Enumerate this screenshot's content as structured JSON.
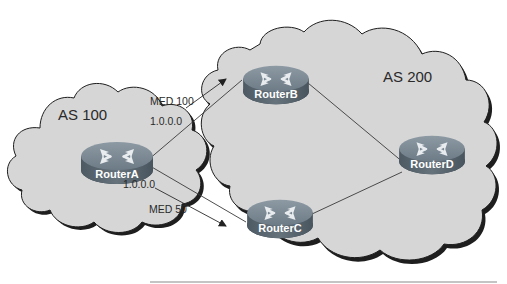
{
  "diagram": {
    "autonomous_systems": [
      {
        "id": "as100",
        "label": "AS 100",
        "fill": "#d6d6d6"
      },
      {
        "id": "as200",
        "label": "AS 200",
        "fill": "#d6d6d6"
      }
    ],
    "routers": [
      {
        "id": "routerA",
        "label": "RouterA",
        "as": "as100"
      },
      {
        "id": "routerB",
        "label": "RouterB",
        "as": "as200"
      },
      {
        "id": "routerC",
        "label": "RouterC",
        "as": "as200"
      },
      {
        "id": "routerD",
        "label": "RouterD",
        "as": "as200"
      }
    ],
    "links": [
      {
        "from": "routerA",
        "to": "routerB"
      },
      {
        "from": "routerA",
        "to": "routerC"
      },
      {
        "from": "routerB",
        "to": "routerD"
      },
      {
        "from": "routerC",
        "to": "routerD"
      }
    ],
    "advertisements": [
      {
        "from": "routerA",
        "to": "routerB",
        "med_label": "MED 100",
        "prefix_label": "1.0.0.0"
      },
      {
        "from": "routerA",
        "to": "routerC",
        "med_label": "MED 50",
        "prefix_label": "1.0.0.0"
      }
    ],
    "colors": {
      "cloud_fill": "#d6d6d6",
      "cloud_outline": "#1e1e1e",
      "router_top": "#7b8a95",
      "router_side": "#5a6873",
      "router_text": "#ffffff",
      "line": "#3a3a3a"
    }
  }
}
